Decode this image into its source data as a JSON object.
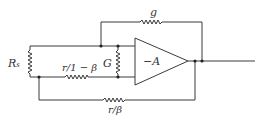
{
  "diagram": {
    "title": "",
    "colors": {
      "wire": "#3a3a3a",
      "text": "#333333",
      "background": "#ffffff"
    },
    "components": {
      "source_resistor": {
        "label": "R",
        "subscript": "s"
      },
      "series_resistor": {
        "label": "r/1 − β"
      },
      "shunt_conductance": {
        "label": "G"
      },
      "feedback_conductance": {
        "label": "g"
      },
      "amplifier": {
        "label": "−A"
      },
      "feedback_resistor": {
        "label": "r/β"
      }
    }
  }
}
